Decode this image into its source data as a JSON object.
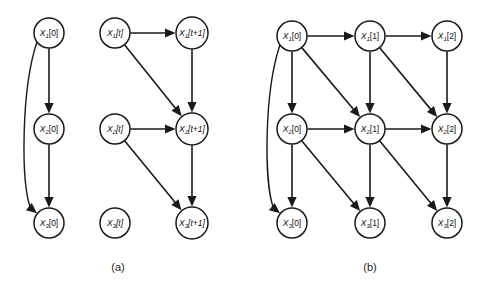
{
  "figure": {
    "background_color": "#ffffff",
    "stroke_color": "#1a1a1a",
    "width": 484,
    "height": 290
  },
  "panels": [
    {
      "id": "a",
      "caption": "(a)",
      "caption_x": 118,
      "caption_y": 268,
      "nodes": [
        {
          "id": "a_x1_0",
          "var": "X",
          "sub": "1",
          "time": "[0]",
          "italic_time": false,
          "cx": 49,
          "cy": 33,
          "r": 15
        },
        {
          "id": "a_x2_0",
          "var": "X",
          "sub": "2",
          "time": "[0]",
          "italic_time": false,
          "cx": 49,
          "cy": 129,
          "r": 15
        },
        {
          "id": "a_x3_0",
          "var": "X",
          "sub": "3",
          "time": "[0]",
          "italic_time": false,
          "cx": 49,
          "cy": 223,
          "r": 15
        },
        {
          "id": "a_x1_t",
          "var": "X",
          "sub": "1",
          "time": "[t]",
          "italic_time": true,
          "cx": 115,
          "cy": 33,
          "r": 15
        },
        {
          "id": "a_x2_t",
          "var": "X",
          "sub": "2",
          "time": "[t]",
          "italic_time": true,
          "cx": 115,
          "cy": 129,
          "r": 15
        },
        {
          "id": "a_x3_t",
          "var": "X",
          "sub": "3",
          "time": "[t]",
          "italic_time": true,
          "cx": 115,
          "cy": 223,
          "r": 15
        },
        {
          "id": "a_x1_t1",
          "var": "X",
          "sub": "1",
          "time": "[t+1]",
          "italic_time": true,
          "cx": 192,
          "cy": 33,
          "r": 16
        },
        {
          "id": "a_x2_t1",
          "var": "X",
          "sub": "2",
          "time": "[t+1]",
          "italic_time": true,
          "cx": 192,
          "cy": 129,
          "r": 16
        },
        {
          "id": "a_x3_t1",
          "var": "X",
          "sub": "3",
          "time": "[t+1]",
          "italic_time": true,
          "cx": 192,
          "cy": 223,
          "r": 16
        }
      ],
      "edges": [
        {
          "from": "a_x1_0",
          "to": "a_x2_0",
          "type": "straight"
        },
        {
          "from": "a_x2_0",
          "to": "a_x3_0",
          "type": "straight"
        },
        {
          "from": "a_x1_0",
          "to": "a_x3_0",
          "type": "curved"
        },
        {
          "from": "a_x1_t",
          "to": "a_x1_t1",
          "type": "straight"
        },
        {
          "from": "a_x1_t",
          "to": "a_x2_t1",
          "type": "straight"
        },
        {
          "from": "a_x1_t1",
          "to": "a_x2_t1",
          "type": "straight"
        },
        {
          "from": "a_x2_t",
          "to": "a_x2_t1",
          "type": "straight"
        },
        {
          "from": "a_x2_t",
          "to": "a_x3_t1",
          "type": "straight"
        },
        {
          "from": "a_x2_t1",
          "to": "a_x3_t1",
          "type": "straight"
        }
      ]
    },
    {
      "id": "b",
      "caption": "(b)",
      "caption_x": 370,
      "caption_y": 268,
      "nodes": [
        {
          "id": "b_x1_0",
          "var": "X",
          "sub": "1",
          "time": "[0]",
          "italic_time": false,
          "cx": 292,
          "cy": 36,
          "r": 15
        },
        {
          "id": "b_x2_0",
          "var": "X",
          "sub": "2",
          "time": "[0]",
          "italic_time": false,
          "cx": 292,
          "cy": 129,
          "r": 15
        },
        {
          "id": "b_x3_0",
          "var": "X",
          "sub": "3",
          "time": "[0]",
          "italic_time": false,
          "cx": 292,
          "cy": 223,
          "r": 15
        },
        {
          "id": "b_x1_1",
          "var": "X",
          "sub": "1",
          "time": "[1]",
          "italic_time": false,
          "cx": 370,
          "cy": 36,
          "r": 15
        },
        {
          "id": "b_x2_1",
          "var": "X",
          "sub": "2",
          "time": "[1]",
          "italic_time": false,
          "cx": 370,
          "cy": 129,
          "r": 15
        },
        {
          "id": "b_x3_1",
          "var": "X",
          "sub": "3",
          "time": "[1]",
          "italic_time": false,
          "cx": 370,
          "cy": 223,
          "r": 15
        },
        {
          "id": "b_x1_2",
          "var": "X",
          "sub": "1",
          "time": "[2]",
          "italic_time": false,
          "cx": 447,
          "cy": 36,
          "r": 15
        },
        {
          "id": "b_x2_2",
          "var": "X",
          "sub": "2",
          "time": "[2]",
          "italic_time": false,
          "cx": 447,
          "cy": 129,
          "r": 15
        },
        {
          "id": "b_x3_2",
          "var": "X",
          "sub": "3",
          "time": "[2]",
          "italic_time": false,
          "cx": 447,
          "cy": 223,
          "r": 15
        }
      ],
      "edges": [
        {
          "from": "b_x1_0",
          "to": "b_x2_0",
          "type": "straight"
        },
        {
          "from": "b_x2_0",
          "to": "b_x3_0",
          "type": "straight"
        },
        {
          "from": "b_x1_0",
          "to": "b_x3_0",
          "type": "curved"
        },
        {
          "from": "b_x1_0",
          "to": "b_x1_1",
          "type": "straight"
        },
        {
          "from": "b_x1_0",
          "to": "b_x2_1",
          "type": "straight"
        },
        {
          "from": "b_x1_1",
          "to": "b_x2_1",
          "type": "straight"
        },
        {
          "from": "b_x2_0",
          "to": "b_x2_1",
          "type": "straight"
        },
        {
          "from": "b_x2_0",
          "to": "b_x3_1",
          "type": "straight"
        },
        {
          "from": "b_x2_1",
          "to": "b_x3_1",
          "type": "straight"
        },
        {
          "from": "b_x1_1",
          "to": "b_x1_2",
          "type": "straight"
        },
        {
          "from": "b_x1_1",
          "to": "b_x2_2",
          "type": "straight"
        },
        {
          "from": "b_x1_2",
          "to": "b_x2_2",
          "type": "straight"
        },
        {
          "from": "b_x2_1",
          "to": "b_x2_2",
          "type": "straight"
        },
        {
          "from": "b_x2_1",
          "to": "b_x3_2",
          "type": "straight"
        },
        {
          "from": "b_x2_2",
          "to": "b_x3_2",
          "type": "straight"
        }
      ]
    }
  ]
}
